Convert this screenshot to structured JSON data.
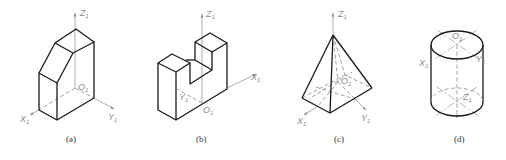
{
  "figures": [
    {
      "id": "a",
      "caption": "(a)",
      "shape": "truncated-prism",
      "axes": {
        "x": "X",
        "y": "Y",
        "z": "Z",
        "origin": "O",
        "subscript": "1"
      }
    },
    {
      "id": "b",
      "caption": "(b)",
      "shape": "notched-block",
      "axes": {
        "x": "X",
        "y": "Y",
        "z": "Z",
        "origin": "O",
        "subscript": "1"
      }
    },
    {
      "id": "c",
      "caption": "(c)",
      "shape": "square-pyramid",
      "axes": {
        "x": "X",
        "y": "Y",
        "z": "Z",
        "origin": "O",
        "subscript": "1"
      }
    },
    {
      "id": "d",
      "caption": "(d)",
      "shape": "cylinder",
      "axes": {
        "x": "X",
        "y": "Y",
        "z": "Z",
        "origin": "O",
        "subscript": "1"
      }
    }
  ],
  "colors": {
    "edge": "#1a1a1a",
    "axis": "#8a8a8a",
    "caption": "#333333"
  }
}
